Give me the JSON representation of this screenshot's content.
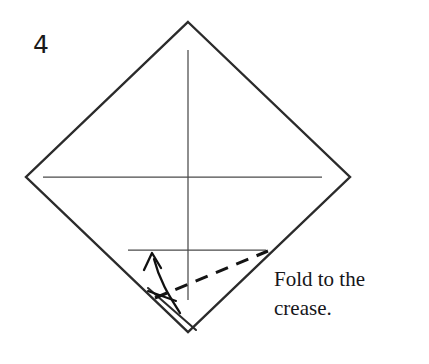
{
  "figure": {
    "step_label": "4",
    "caption": "Fold to the\ncrease.",
    "colors": {
      "paper_outline": "#2b2b2b",
      "crease_line": "#4a4a4a",
      "fold_line": "#141414",
      "arrow": "#111111",
      "text": "#16161a",
      "background": "#ffffff"
    },
    "shapes": {
      "paper_outline_name": "square-paper-diamond-orientation",
      "paper_vertices": [
        {
          "name": "top",
          "x": 188,
          "y": 22
        },
        {
          "name": "right",
          "x": 350,
          "y": 177
        },
        {
          "name": "bottom",
          "x": 188,
          "y": 332
        },
        {
          "name": "left",
          "x": 26,
          "y": 177
        }
      ],
      "horizontal_crease": {
        "x1": 43,
        "y1": 177,
        "x2": 322,
        "y2": 177
      },
      "vertical_crease": {
        "x1": 188,
        "y1": 50,
        "x2": 188,
        "y2": 300
      },
      "lower_crease": {
        "x1": 128,
        "y1": 250,
        "x2": 266,
        "y2": 250
      },
      "fold_line_dashed": {
        "x1": 155,
        "y1": 298,
        "x2": 268,
        "y2": 251,
        "dash": "13 9"
      },
      "flap_edge": {
        "x1": 148,
        "y1": 288,
        "x2": 196,
        "y2": 330
      },
      "arrow_path": "M 180 313 C 172 300, 160 283, 154 259",
      "arrow_tip": {
        "x": 152,
        "y": 254
      },
      "arrow_tail_tick": {
        "x1": 148,
        "y1": 291,
        "x2": 176,
        "y2": 301
      }
    }
  }
}
